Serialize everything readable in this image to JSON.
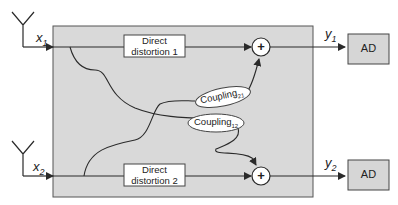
{
  "diagram": {
    "inputs": [
      {
        "id": "x1",
        "label": "x",
        "sub": "1"
      },
      {
        "id": "x2",
        "label": "x",
        "sub": "2"
      }
    ],
    "outputs": [
      {
        "id": "y1",
        "label": "y",
        "sub": "1"
      },
      {
        "id": "y2",
        "label": "y",
        "sub": "2"
      }
    ],
    "blocks": {
      "direct1": {
        "line1": "Direct",
        "line2": "distortion 1"
      },
      "direct2": {
        "line1": "Direct",
        "line2": "distortion 2"
      },
      "ad1": "AD",
      "ad2": "AD"
    },
    "couplings": [
      {
        "id": "c21",
        "label": "Coupling",
        "sub": "21"
      },
      {
        "id": "c12",
        "label": "Coupling",
        "sub": "12"
      }
    ],
    "summers": [
      {
        "id": "sum1",
        "symbol": "+"
      },
      {
        "id": "sum2",
        "symbol": "+"
      }
    ],
    "colors": {
      "system_box": "#d9d9d9",
      "ad_box": "#d6d6d6",
      "line": "#2a2a2a"
    }
  }
}
